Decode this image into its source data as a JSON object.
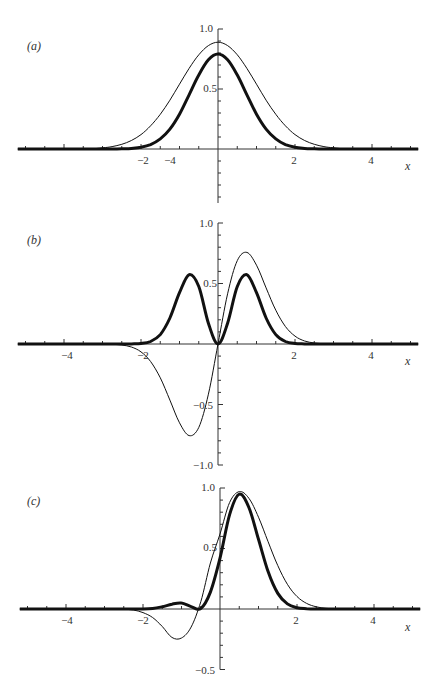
{
  "chart_data": [
    {
      "type": "line",
      "panel_label": "(a)",
      "xlabel": "x",
      "ylabel": "",
      "xlim": [
        -5.2,
        5.2
      ],
      "ylim": [
        -0.45,
        1.0
      ],
      "x_ticks": [
        "-4",
        "-2",
        "2",
        "4"
      ],
      "y_ticks": [
        "1.0",
        "0.5"
      ],
      "grid": false,
      "x": [
        -3,
        -2.75,
        -2.5,
        -2.25,
        -2,
        -1.75,
        -1.5,
        -1.25,
        -1,
        -0.75,
        -0.5,
        -0.25,
        0,
        0.25,
        0.5,
        0.75,
        1,
        1.25,
        1.5,
        1.75,
        2,
        2.25,
        2.5,
        2.75,
        3
      ],
      "series": [
        {
          "name": "thin",
          "stroke_width": 1,
          "values": [
            0.01,
            0.02,
            0.039,
            0.071,
            0.12,
            0.193,
            0.289,
            0.407,
            0.54,
            0.672,
            0.785,
            0.862,
            0.89,
            0.862,
            0.785,
            0.672,
            0.54,
            0.407,
            0.289,
            0.193,
            0.12,
            0.071,
            0.039,
            0.02,
            0.01
          ]
        },
        {
          "name": "thick",
          "stroke_width": 3,
          "values": [
            0.0001,
            0.0004,
            0.0015,
            0.005,
            0.0145,
            0.037,
            0.084,
            0.166,
            0.29,
            0.452,
            0.617,
            0.743,
            0.792,
            0.743,
            0.617,
            0.452,
            0.29,
            0.166,
            0.084,
            0.037,
            0.0145,
            0.005,
            0.0015,
            0.0004,
            0.0001
          ]
        }
      ]
    },
    {
      "type": "line",
      "panel_label": "(b)",
      "xlabel": "x",
      "ylabel": "",
      "xlim": [
        -5.2,
        5.2
      ],
      "ylim": [
        -1.0,
        1.0
      ],
      "x_ticks": [
        "-4",
        "-2",
        "2",
        "4"
      ],
      "y_ticks": [
        "1.0",
        "0.5",
        "-0.5",
        "-1.0"
      ],
      "grid": false,
      "x": [
        -3,
        -2.75,
        -2.5,
        -2.25,
        -2,
        -1.75,
        -1.5,
        -1.25,
        -1,
        -0.75,
        -0.5,
        -0.25,
        0,
        0.25,
        0.5,
        0.75,
        1,
        1.25,
        1.5,
        1.75,
        2,
        2.25,
        2.5,
        2.75,
        3
      ],
      "series": [
        {
          "name": "thin",
          "stroke_width": 1,
          "values": [
            -0.0007,
            -0.0025,
            -0.0085,
            -0.025,
            -0.065,
            -0.145,
            -0.279,
            -0.464,
            -0.651,
            -0.757,
            -0.689,
            -0.415,
            0,
            0.415,
            0.689,
            0.757,
            0.651,
            0.464,
            0.279,
            0.145,
            0.065,
            0.025,
            0.0085,
            0.0025,
            0.0007
          ]
        },
        {
          "name": "thick",
          "stroke_width": 3,
          "values": [
            0,
            0,
            0,
            0.0006,
            0.0042,
            0.021,
            0.078,
            0.215,
            0.424,
            0.573,
            0.475,
            0.172,
            0,
            0.172,
            0.475,
            0.573,
            0.424,
            0.215,
            0.078,
            0.021,
            0.0042,
            0.0006,
            0,
            0,
            0
          ]
        }
      ]
    },
    {
      "type": "line",
      "panel_label": "(c)",
      "xlabel": "x",
      "ylabel": "",
      "xlim": [
        -5.2,
        5.2
      ],
      "ylim": [
        -0.5,
        1.0
      ],
      "x_ticks": [
        "-4",
        "-2",
        "2",
        "4"
      ],
      "y_ticks": [
        "1.0",
        "0.5",
        "-0.5"
      ],
      "grid": false,
      "x": [
        -3,
        -2.75,
        -2.5,
        -2.25,
        -2,
        -1.75,
        -1.5,
        -1.25,
        -1,
        -0.75,
        -0.5,
        -0.25,
        0,
        0.25,
        0.5,
        0.75,
        1,
        1.25,
        1.5,
        1.75,
        2,
        2.25,
        2.5,
        2.75,
        3
      ],
      "series": [
        {
          "name": "thin",
          "stroke_width": 1,
          "values": [
            0,
            -0.001,
            -0.003,
            -0.008,
            -0.03,
            -0.07,
            -0.145,
            -0.235,
            -0.24,
            -0.15,
            0.06,
            0.38,
            0.62,
            0.88,
            0.97,
            0.915,
            0.759,
            0.556,
            0.359,
            0.204,
            0.103,
            0.046,
            0.018,
            0.006,
            0.002
          ]
        },
        {
          "name": "thick",
          "stroke_width": 3,
          "values": [
            0,
            0,
            0,
            0,
            0.0005,
            0.004,
            0.018,
            0.04,
            0.05,
            0.02,
            0.004,
            0.14,
            0.42,
            0.78,
            0.95,
            0.839,
            0.576,
            0.309,
            0.129,
            0.042,
            0.011,
            0.002,
            0,
            0,
            0
          ]
        }
      ]
    }
  ],
  "panels": [
    {
      "label": "(a)",
      "x_axis_title": "x",
      "y_tick_labels": [
        "1.0",
        "0.5"
      ],
      "x_tick_labels": [
        "-4",
        "-2",
        "2",
        "4"
      ]
    },
    {
      "label": "(b)",
      "x_axis_title": "x",
      "y_tick_labels": [
        "1.0",
        "0.5",
        "-0.5",
        "-1.0"
      ],
      "x_tick_labels": [
        "-4",
        "-2",
        "2",
        "4"
      ]
    },
    {
      "label": "(c)",
      "x_axis_title": "x",
      "y_tick_labels": [
        "1.0",
        "0.5",
        "-0.5"
      ],
      "x_tick_labels": [
        "-4",
        "-2",
        "2",
        "4"
      ]
    }
  ],
  "style": {
    "line_color": "#111111",
    "axis_color": "#333333",
    "background": "#ffffff"
  }
}
